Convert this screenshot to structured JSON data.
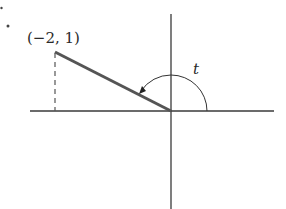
{
  "item_marker": "7.",
  "point_label": "(−2, 1)",
  "angle_label": "t",
  "colors": {
    "axis": "#3a3a3a",
    "segment": "#555555",
    "dashed": "#555555",
    "arc": "#333333",
    "text": "#2a2a2a"
  },
  "geometry": {
    "origin": [
      171,
      111
    ],
    "point": [
      -2,
      1
    ],
    "point_px": [
      57,
      52
    ],
    "arc_radius_px": 36
  }
}
